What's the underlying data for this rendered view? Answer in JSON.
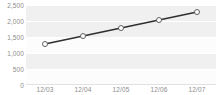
{
  "chart_data": {
    "type": "line",
    "title": "",
    "subtitle": "",
    "xlabel": "",
    "ylabel": "",
    "categories": [
      "12/03",
      "12/04",
      "12/05",
      "12/06",
      "12/07"
    ],
    "x": [
      "12/03",
      "12/04",
      "12/05",
      "12/06",
      "12/07"
    ],
    "values": [
      1280,
      1530,
      1780,
      2030,
      2280
    ],
    "series": [
      {
        "name": "series-1",
        "values": [
          1280,
          1530,
          1780,
          2030,
          2280
        ]
      }
    ],
    "ylim": [
      0,
      2500
    ],
    "y_ticks": [
      0,
      500,
      1000,
      1500,
      2000,
      2500
    ],
    "y_tick_labels": [
      "0",
      "500",
      "1,000",
      "1,500",
      "2,000",
      "2,500"
    ],
    "x_tick_labels": [
      "12/03",
      "12/04",
      "12/05",
      "12/06",
      "12/07"
    ],
    "grid": true,
    "grid_orientation": "horizontal",
    "legend": false,
    "legend_position": "none",
    "marker": "open-circle",
    "colors": {
      "line": "#303030",
      "marker_fill": "#ffffff",
      "marker_stroke": "#606060",
      "band": "#f0f0f0",
      "plot_background": "#fcfcfc",
      "gridline": "#ffffff",
      "axis_line": "#e2e2e2",
      "tick_label": "#8d8d8d",
      "page_background": "#ffffff"
    }
  }
}
